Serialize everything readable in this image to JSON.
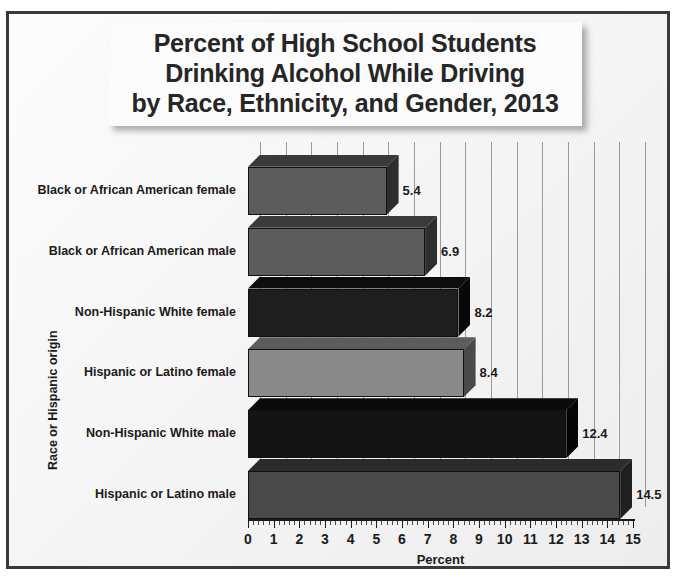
{
  "figure": {
    "title_lines": [
      "Percent of High School Students",
      "Drinking Alcohol While Driving",
      "by Race, Ethnicity, and Gender, 2013"
    ],
    "frame_border_color": "#3a3a3a",
    "background_color": "#f4f4f4",
    "title_box_color": "#fbfbfb"
  },
  "chart_data": {
    "type": "bar",
    "orientation": "horizontal",
    "style": "3d",
    "title": "Percent of High School Students Drinking Alcohol While Driving by Race, Ethnicity, and Gender, 2013",
    "xlabel": "Percent",
    "ylabel": "Race or Hispanic origin",
    "xlim": [
      0,
      15
    ],
    "xticks": [
      0,
      1,
      2,
      3,
      4,
      5,
      6,
      7,
      8,
      9,
      10,
      11,
      12,
      13,
      14,
      15
    ],
    "xtick_labels": [
      "0",
      "1",
      "2",
      "3",
      "4",
      "5",
      "6",
      "7",
      "8",
      "9",
      "10",
      "11",
      "12",
      "13",
      "14",
      "15"
    ],
    "minor_ticks_per_interval": 5,
    "grid": true,
    "grid_axis": "x",
    "legend": false,
    "categories": [
      "Black or African American female",
      "Black or African American male",
      "Non-Hispanic White female",
      "Hispanic or Latino female",
      "Non-Hispanic White male",
      "Hispanic or Latino male"
    ],
    "values": [
      5.4,
      6.9,
      8.2,
      8.4,
      12.4,
      14.5
    ],
    "value_labels": [
      "5.4",
      "6.9",
      "8.2",
      "8.4",
      "12.4",
      "14.5"
    ],
    "bar_colors": [
      "#5c5c5c",
      "#5c5c5c",
      "#1e1e1e",
      "#8a8a8a",
      "#141414",
      "#4a4a4a"
    ],
    "bar_top_colors": [
      "#3a3a3a",
      "#3a3a3a",
      "#0d0d0d",
      "#5c5c5c",
      "#0a0a0a",
      "#2b2b2b"
    ],
    "bar_side_colors": [
      "#2e2e2e",
      "#2e2e2e",
      "#080808",
      "#4a4a4a",
      "#050505",
      "#202020"
    ],
    "grid_color": "#9a9a9a",
    "axis_color": "#1a1a1a"
  }
}
